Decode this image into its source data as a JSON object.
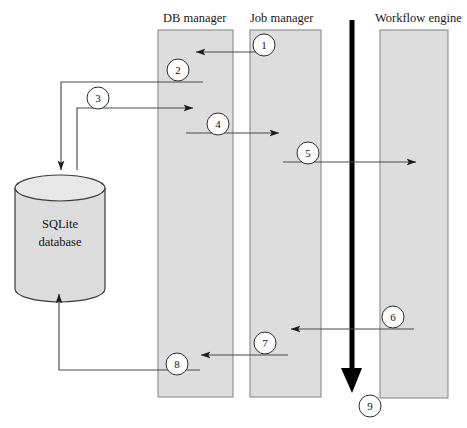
{
  "diagram": {
    "canvas": {
      "width": 467,
      "height": 428,
      "background": "#ffffff"
    },
    "colors": {
      "lane_fill": "#dddddd",
      "lane_stroke": "#8a8a8a",
      "cylinder_fill": "#dcdcdc",
      "cylinder_stroke": "#3b3b3b",
      "arrow": "#4a4a4a",
      "thick_arrow": "#000000",
      "circle_fill": "#ffffff",
      "circle_stroke": "#2b2b2b",
      "text": "#141414"
    },
    "lanes": [
      {
        "id": "db-manager",
        "label": "DB manager",
        "label_x": 163,
        "label_y": 22,
        "x": 158,
        "y": 30,
        "width": 75,
        "height": 367
      },
      {
        "id": "job-manager",
        "label": "Job manager",
        "label_x": 250,
        "label_y": 22,
        "x": 250,
        "y": 30,
        "width": 71,
        "height": 367
      },
      {
        "id": "workflow-engine",
        "label": "Workflow engine",
        "label_x": 375,
        "label_y": 22,
        "x": 380,
        "y": 30,
        "width": 68,
        "height": 368
      }
    ],
    "datastore": {
      "id": "sqlite-database",
      "label_line1": "SQLite",
      "label_line2": "database",
      "x": 15,
      "y": 175,
      "width": 90,
      "height": 114,
      "ellipse_ry": 13
    },
    "timeline": {
      "id": "time-axis",
      "label": "time-arrow",
      "x": 352,
      "y_start": 20,
      "y_end": 393,
      "thickness": 5
    },
    "steps": [
      {
        "n": "1",
        "cx": 264,
        "cy": 45
      },
      {
        "n": "2",
        "cx": 178,
        "cy": 70
      },
      {
        "n": "3",
        "cx": 98,
        "cy": 98
      },
      {
        "n": "4",
        "cx": 218,
        "cy": 124
      },
      {
        "n": "5",
        "cx": 308,
        "cy": 153
      },
      {
        "n": "6",
        "cx": 393,
        "cy": 317
      },
      {
        "n": "7",
        "cx": 265,
        "cy": 343
      },
      {
        "n": "8",
        "cx": 177,
        "cy": 364
      },
      {
        "n": "9",
        "cx": 370,
        "cy": 406
      }
    ],
    "flows": [
      {
        "id": "flow-1-job-to-db",
        "from": "job-manager",
        "to": "db-manager",
        "direction": "left",
        "y": 52
      },
      {
        "id": "flow-2-db-to-store",
        "from": "db-manager",
        "to": "sqlite-database",
        "direction": "down",
        "y": 82
      },
      {
        "id": "flow-3-store-to-db",
        "from": "sqlite-database",
        "to": "db-manager",
        "direction": "right",
        "y": 108
      },
      {
        "id": "flow-4-db-to-job",
        "from": "db-manager",
        "to": "job-manager",
        "direction": "right",
        "y": 133
      },
      {
        "id": "flow-5-job-to-engine",
        "from": "job-manager",
        "to": "workflow-engine",
        "direction": "right",
        "y": 162
      },
      {
        "id": "flow-6-engine-to-job",
        "from": "workflow-engine",
        "to": "job-manager",
        "direction": "left",
        "y": 329
      },
      {
        "id": "flow-7-job-to-db",
        "from": "job-manager",
        "to": "db-manager",
        "direction": "left",
        "y": 355
      },
      {
        "id": "flow-8-db-to-store",
        "from": "db-manager",
        "to": "sqlite-database",
        "direction": "up",
        "y": 370
      }
    ]
  }
}
